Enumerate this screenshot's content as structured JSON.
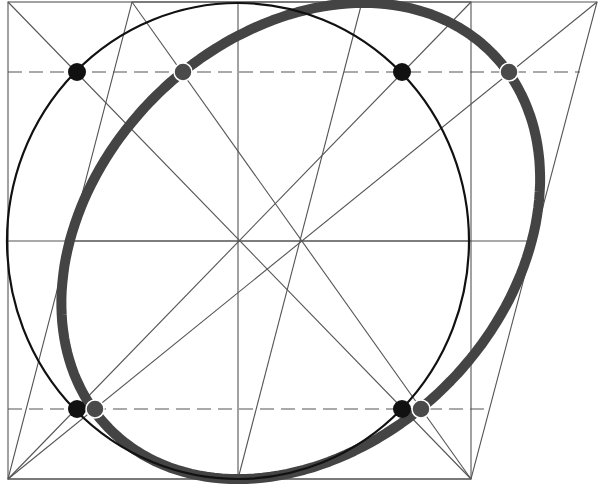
{
  "diagram": {
    "type": "geometric-construction",
    "colors": {
      "background": "#ffffff",
      "thin_line": "#555555",
      "circle": "#111111",
      "ellipse": "#444444",
      "black_dot": "#111111",
      "gray_dot": "#4a4a4a",
      "dashed": "#555555"
    },
    "square": {
      "x1": 8,
      "y1": 2,
      "x2": 471,
      "y2": 479
    },
    "parallelogram": {
      "points": [
        [
          132,
          2
        ],
        [
          597,
          2
        ],
        [
          471,
          479
        ],
        [
          8,
          479
        ]
      ]
    },
    "circle": {
      "cx": 238,
      "cy": 241,
      "rx": 231,
      "ry": 238
    },
    "ellipse": {
      "shear": 0.2636,
      "base_y": 479
    },
    "center_lines": {
      "horizontal": {
        "y": 241,
        "x1": 8,
        "x2": 471
      },
      "vertical": {
        "x": 238,
        "y1": 2,
        "y2": 479
      },
      "sheared_vertical": {
        "x1": 238,
        "y1": 479,
        "x2": 362,
        "y2": 2
      },
      "sheared_horizontal": {
        "x1": 71,
        "y1": 241,
        "x2": 534,
        "y2": 241
      }
    },
    "dashed_lines": [
      {
        "y": 72,
        "x1": 8,
        "x2": 580
      },
      {
        "y": 409,
        "x1": 8,
        "x2": 490
      }
    ],
    "diagonals": [
      {
        "name": "square-diagonal-1",
        "from": [
          8,
          2
        ],
        "to": [
          471,
          479
        ]
      },
      {
        "name": "square-diagonal-2",
        "from": [
          471,
          2
        ],
        "to": [
          8,
          479
        ]
      },
      {
        "name": "parallelogram-diagonal-1",
        "from": [
          132,
          2
        ],
        "to": [
          471,
          479
        ]
      },
      {
        "name": "parallelogram-diagonal-2",
        "from": [
          597,
          2
        ],
        "to": [
          8,
          479
        ]
      }
    ],
    "black_dots": [
      {
        "cx": 77,
        "cy": 72,
        "r": 9
      },
      {
        "cx": 402,
        "cy": 72,
        "r": 9
      },
      {
        "cx": 77,
        "cy": 409,
        "r": 9
      },
      {
        "cx": 402,
        "cy": 409,
        "r": 9
      }
    ],
    "gray_dots": [
      {
        "cx": 183,
        "cy": 72,
        "r": 9
      },
      {
        "cx": 509,
        "cy": 72,
        "r": 9
      },
      {
        "cx": 95,
        "cy": 409,
        "r": 9
      },
      {
        "cx": 421,
        "cy": 409,
        "r": 9
      }
    ]
  }
}
